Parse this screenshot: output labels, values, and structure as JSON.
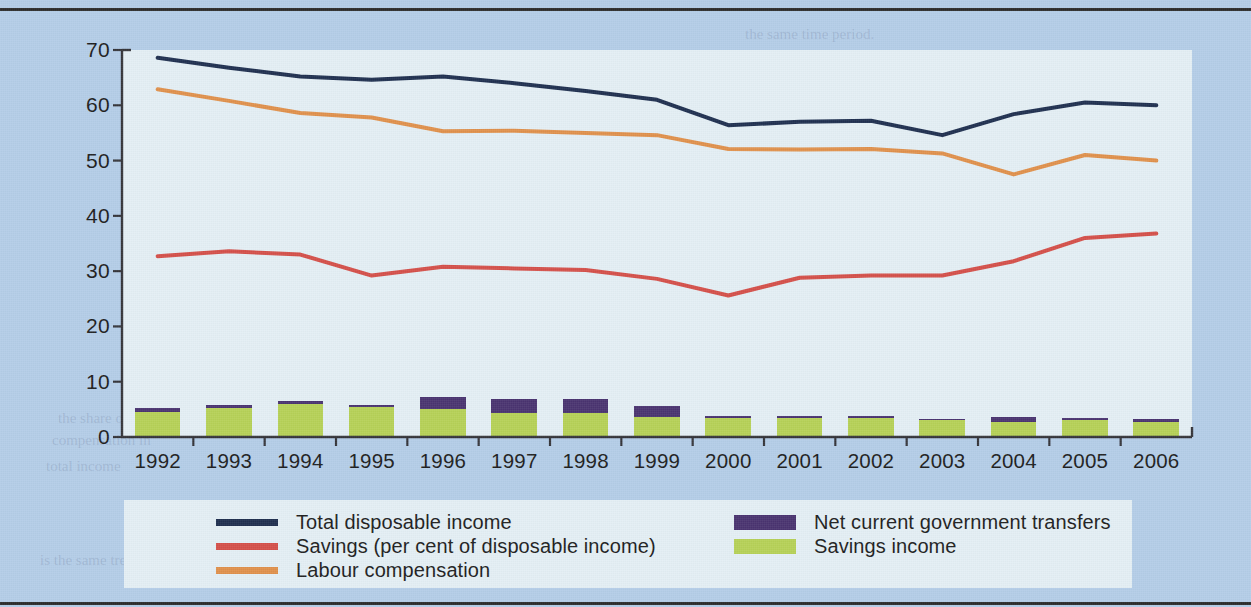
{
  "chart_data": {
    "type": "line",
    "title": "",
    "subtitle": "",
    "xlabel": "",
    "ylabel": "",
    "categories": [
      "1992",
      "1993",
      "1994",
      "1995",
      "1996",
      "1997",
      "1998",
      "1999",
      "2000",
      "2001",
      "2002",
      "2003",
      "2004",
      "2005",
      "2006"
    ],
    "ylim": [
      0,
      70
    ],
    "ytick_values": [
      0,
      10,
      20,
      30,
      40,
      50,
      60,
      70
    ],
    "ytick_labels": [
      "0",
      "10",
      "20",
      "30",
      "40",
      "50",
      "60",
      "70"
    ],
    "grid": false,
    "legend_position": "bottom",
    "series": [
      {
        "name": "Total disposable income",
        "type": "line",
        "color": "#1f3050",
        "values": [
          68.6,
          66.8,
          65.2,
          64.6,
          65.2,
          64.0,
          62.6,
          61.0,
          56.4,
          57.0,
          57.2,
          54.6,
          58.4,
          60.5,
          60.0
        ]
      },
      {
        "name": "Savings (per cent of disposable income)",
        "type": "line",
        "color": "#d4504a",
        "values": [
          32.7,
          33.6,
          33.0,
          29.2,
          30.8,
          30.5,
          30.2,
          28.6,
          25.6,
          28.8,
          29.2,
          29.2,
          31.8,
          36.0,
          36.8
        ]
      },
      {
        "name": "Labour compensation",
        "type": "line",
        "color": "#e0914c",
        "values": [
          62.9,
          60.8,
          58.6,
          57.8,
          55.3,
          55.4,
          55.0,
          54.6,
          52.1,
          52.0,
          52.1,
          51.3,
          47.5,
          51.0,
          50.0
        ]
      },
      {
        "name": "Net current government transfers",
        "type": "bar-stack-top",
        "color": "#4a3470",
        "values": [
          0.7,
          0.6,
          0.5,
          0.4,
          2.1,
          2.4,
          2.5,
          1.9,
          0.4,
          0.4,
          0.4,
          0.3,
          0.8,
          0.4,
          0.4
        ]
      },
      {
        "name": "Savings income",
        "type": "bar-stack-bottom",
        "color": "#b6d157",
        "values": [
          4.6,
          5.2,
          6.0,
          5.4,
          5.1,
          4.4,
          4.4,
          3.7,
          3.4,
          3.4,
          3.4,
          3.0,
          2.8,
          3.0,
          2.8
        ]
      }
    ]
  },
  "legend": {
    "left_column": [
      {
        "label": "Total disposable income",
        "swatch": "line",
        "color": "#1f3050"
      },
      {
        "label": "Savings (per cent of disposable income)",
        "swatch": "line",
        "color": "#d4504a"
      },
      {
        "label": "Labour compensation",
        "swatch": "line",
        "color": "#e0914c"
      }
    ],
    "right_column": [
      {
        "label": "Net current government transfers",
        "swatch": "block",
        "color": "#4a3470"
      },
      {
        "label": "Savings income",
        "swatch": "block",
        "color": "#b6d157"
      }
    ]
  },
  "colors": {
    "page_background": "#b4cde8",
    "plot_background": "#e4eff5",
    "legend_background": "#e4eff5",
    "axis": "#35353a",
    "rule": "#2c2c2c"
  },
  "page_show_through": [
    {
      "text": "the same time period.",
      "x": 745,
      "y": 26
    },
    {
      "text": "in household saving rates over",
      "x": 690,
      "y": 47
    },
    {
      "text": "the decline in disposable income",
      "x": 706,
      "y": 70
    },
    {
      "text": "compensation appears to",
      "x": 720,
      "y": 95
    },
    {
      "text": "households have adjusted",
      "x": 716,
      "y": 118
    },
    {
      "text": "in their saving behaviour",
      "x": 742,
      "y": 143
    },
    {
      "text": "incomes declined",
      "x": 760,
      "y": 168
    },
    {
      "text": "over the period",
      "x": 768,
      "y": 190
    },
    {
      "text": "and the relative",
      "x": 752,
      "y": 216
    },
    {
      "text": "while the labour share",
      "x": 722,
      "y": 238
    },
    {
      "text": "of total disposable income",
      "x": 700,
      "y": 262
    },
    {
      "text": "fell steadily, reflecting the labour",
      "x": 678,
      "y": 288
    },
    {
      "text": "share and the saving rate in OECD",
      "x": 672,
      "y": 312
    },
    {
      "text": "economies over time",
      "x": 700,
      "y": 336
    },
    {
      "text": "the relationship between",
      "x": 706,
      "y": 360
    },
    {
      "text": "household saving and",
      "x": 712,
      "y": 386
    },
    {
      "text": "the share of labour",
      "x": 58,
      "y": 410
    },
    {
      "text": "compensation in",
      "x": 52,
      "y": 432
    },
    {
      "text": "total income",
      "x": 46,
      "y": 458
    },
    {
      "text": "is the same trend",
      "x": 40,
      "y": 552
    }
  ]
}
